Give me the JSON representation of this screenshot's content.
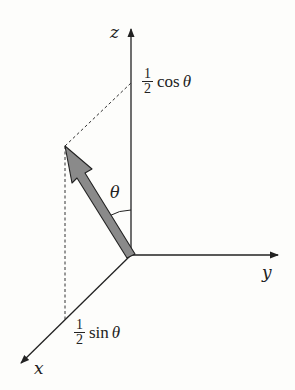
{
  "diagram": {
    "axes": {
      "x": "x",
      "y": "y",
      "z": "z"
    },
    "angle_label": "θ",
    "z_projection": {
      "numerator": "1",
      "denominator": "2",
      "func": "cos",
      "arg": "θ"
    },
    "x_projection": {
      "numerator": "1",
      "denominator": "2",
      "func": "sin",
      "arg": "θ"
    },
    "colors": {
      "line": "#222222",
      "vector_fill": "#8a8a8a",
      "background": "#fdfdfb"
    }
  }
}
